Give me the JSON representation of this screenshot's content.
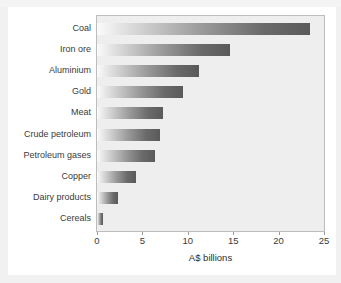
{
  "caption": {
    "text": ""
  },
  "chart_data": {
    "type": "bar",
    "orientation": "horizontal",
    "title": "",
    "subtitle": "",
    "xlabel": "A$ billions",
    "ylabel": "",
    "xlim": [
      0,
      25
    ],
    "xticks": [
      0,
      5,
      10,
      15,
      20,
      25
    ],
    "xtick_labels": [
      "0",
      "5",
      "10",
      "15",
      "20",
      "25"
    ],
    "grid": false,
    "legend": false,
    "legend_position": "none",
    "categories": [
      "Coal",
      "Iron ore",
      "Aluminium",
      "Gold",
      "Meat",
      "Crude petroleum",
      "Petroleum gases",
      "Copper",
      "Dairy products",
      "Cereals"
    ],
    "values": [
      23.5,
      14.7,
      11.2,
      9.5,
      7.3,
      6.9,
      6.4,
      4.3,
      2.3,
      0.7
    ],
    "bar_style": {
      "gradient_from": "#fbfbfb",
      "gradient_to": "#5a5a5a"
    },
    "plot_background": "#eeeeee",
    "frame_color": "#bdbdbd"
  }
}
